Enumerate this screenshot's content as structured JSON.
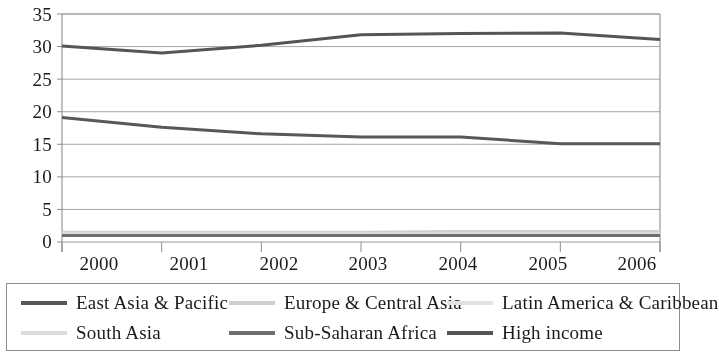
{
  "chart_data": {
    "type": "line",
    "title": "",
    "subtitle": "",
    "xlabel": "",
    "ylabel": "",
    "x": [
      "2000",
      "2001",
      "2002",
      "2003",
      "2004",
      "2005",
      "2006"
    ],
    "categories": [
      "2000",
      "2001",
      "2002",
      "2003",
      "2004",
      "2005",
      "2006"
    ],
    "ylim": [
      0,
      35
    ],
    "yticks": [
      "0",
      "5",
      "10",
      "15",
      "20",
      "25",
      "30",
      "35"
    ],
    "grid": "horizontal",
    "legend_position": "bottom",
    "legend_columns": 3,
    "series": [
      {
        "name": "East Asia & Pacific",
        "color": "#585858",
        "values": [
          19.1,
          17.6,
          16.6,
          16.1,
          16.1,
          15.1,
          15.1
        ]
      },
      {
        "name": "Europe & Central Asia",
        "color": "#cfcfcf",
        "values": [
          1.5,
          1.5,
          1.5,
          1.5,
          1.6,
          1.6,
          1.6
        ]
      },
      {
        "name": "Latin America & Caribbean",
        "color": "#e2e2e2",
        "values": [
          1.4,
          1.4,
          1.4,
          1.4,
          1.5,
          1.5,
          1.5
        ]
      },
      {
        "name": "South Asia",
        "color": "#dcdcdc",
        "values": [
          1.3,
          1.3,
          1.3,
          1.3,
          1.3,
          1.3,
          1.3
        ]
      },
      {
        "name": "Sub-Saharan Africa",
        "color": "#6e6e6e",
        "values": [
          1.0,
          1.0,
          1.0,
          1.0,
          1.0,
          1.0,
          1.0
        ]
      },
      {
        "name": "High income",
        "color": "#555555",
        "values": [
          30.1,
          29.0,
          30.2,
          31.8,
          32.0,
          32.1,
          31.1
        ]
      }
    ]
  },
  "axes": {
    "y_ticks": [
      "35",
      "30",
      "25",
      "20",
      "15",
      "10",
      "5",
      "0"
    ],
    "x_ticks": [
      "2000",
      "2001",
      "2002",
      "2003",
      "2004",
      "2005",
      "2006"
    ]
  },
  "legend": {
    "items": [
      {
        "label": "East Asia & Pacific",
        "color": "#585858"
      },
      {
        "label": "Europe & Central Asia",
        "color": "#cfcfcf"
      },
      {
        "label": "Latin America & Caribbean",
        "color": "#e2e2e2"
      },
      {
        "label": "South Asia",
        "color": "#dcdcdc"
      },
      {
        "label": "Sub-Saharan Africa",
        "color": "#6e6e6e"
      },
      {
        "label": "High income",
        "color": "#555555"
      }
    ]
  },
  "style": {
    "background": "#ffffff",
    "grid_color": "#9a9a9a",
    "axis_color": "#8d8d8d",
    "text_color": "#1b1b1b"
  }
}
